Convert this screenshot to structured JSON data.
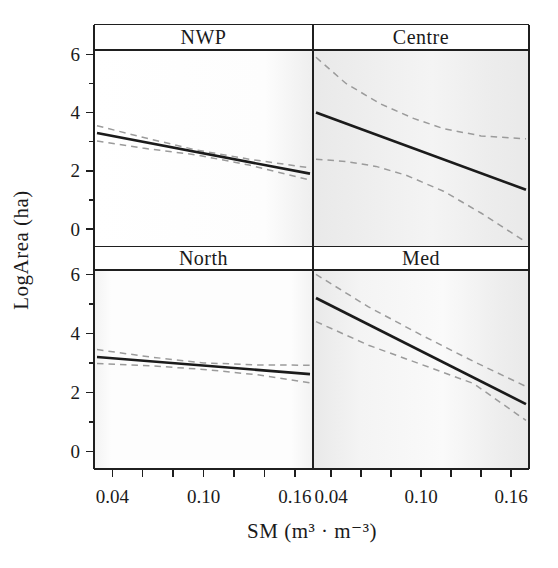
{
  "figure": {
    "background": "#ffffff"
  },
  "chart_data": {
    "type": "line",
    "title": "",
    "xlabel": "SM (m³ · m⁻³)",
    "ylabel": "LogArea (ha)",
    "layout": "2x2 lattice panels, shared axes, strip titles on top of each panel",
    "xlim": [
      0.028,
      0.172
    ],
    "ylim": [
      -0.6,
      6.15
    ],
    "x_major_ticks": [
      0.04,
      0.1,
      0.16
    ],
    "x_tick_labels": [
      "0.04",
      "0.10",
      "0.16"
    ],
    "x_minor_ticks": [
      0.06,
      0.08,
      0.12,
      0.14
    ],
    "y_major_ticks": [
      0,
      2,
      4,
      6
    ],
    "y_tick_labels": [
      "0",
      "2",
      "4",
      "6"
    ],
    "y_minor_ticks": [
      1,
      3,
      5
    ],
    "grid": false,
    "legend": false,
    "colors": {
      "fit_line": "#1b1b1b",
      "ci_line": "#9b9b9b",
      "frame": "#1f1f1f",
      "text": "#1a1a1a",
      "panel_tint": "#e9e9e9"
    },
    "panels": [
      {
        "label": "NWP",
        "row": 0,
        "col": 0,
        "fit": {
          "x": [
            0.03,
            0.17
          ],
          "y": [
            3.3,
            1.9
          ]
        },
        "upper_ci": {
          "x": [
            0.03,
            0.06,
            0.095,
            0.13,
            0.17
          ],
          "y": [
            3.55,
            3.15,
            2.72,
            2.4,
            2.1
          ]
        },
        "lower_ci": {
          "x": [
            0.03,
            0.06,
            0.095,
            0.13,
            0.17
          ],
          "y": [
            3.02,
            2.78,
            2.55,
            2.2,
            1.68
          ]
        }
      },
      {
        "label": "Centre",
        "row": 0,
        "col": 1,
        "fit": {
          "x": [
            0.03,
            0.17
          ],
          "y": [
            4.0,
            1.35
          ]
        },
        "upper_ci": {
          "x": [
            0.03,
            0.05,
            0.073,
            0.095,
            0.115,
            0.14,
            0.17
          ],
          "y": [
            5.9,
            5.0,
            4.3,
            3.8,
            3.45,
            3.2,
            3.1
          ]
        },
        "lower_ci": {
          "x": [
            0.03,
            0.05,
            0.07,
            0.09,
            0.115,
            0.14,
            0.17
          ],
          "y": [
            2.4,
            2.32,
            2.15,
            1.85,
            1.3,
            0.55,
            -0.45
          ]
        }
      },
      {
        "label": "North",
        "row": 1,
        "col": 0,
        "fit": {
          "x": [
            0.03,
            0.17
          ],
          "y": [
            3.2,
            2.62
          ]
        },
        "upper_ci": {
          "x": [
            0.03,
            0.065,
            0.1,
            0.135,
            0.17
          ],
          "y": [
            3.45,
            3.2,
            3.0,
            2.93,
            2.92
          ]
        },
        "lower_ci": {
          "x": [
            0.03,
            0.065,
            0.1,
            0.135,
            0.17
          ],
          "y": [
            2.98,
            2.9,
            2.78,
            2.6,
            2.32
          ]
        }
      },
      {
        "label": "Med",
        "row": 1,
        "col": 1,
        "fit": {
          "x": [
            0.03,
            0.17
          ],
          "y": [
            5.2,
            1.6
          ]
        },
        "upper_ci": {
          "x": [
            0.03,
            0.065,
            0.1,
            0.135,
            0.17
          ],
          "y": [
            6.0,
            4.9,
            3.95,
            3.05,
            2.2
          ]
        },
        "lower_ci": {
          "x": [
            0.03,
            0.065,
            0.1,
            0.135,
            0.17
          ],
          "y": [
            4.4,
            3.6,
            2.95,
            2.3,
            1.05
          ]
        }
      }
    ]
  }
}
